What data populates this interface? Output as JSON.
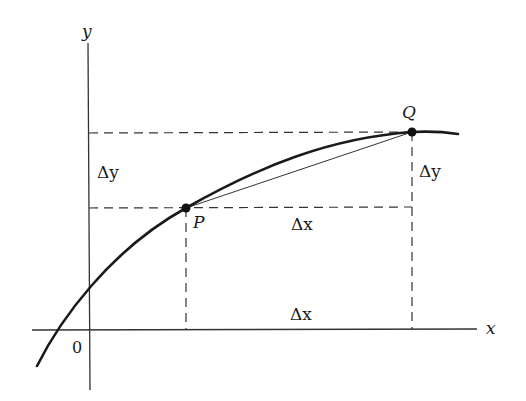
{
  "diagram": {
    "axes": {
      "x_label": "x",
      "y_label": "y",
      "origin_label": "0"
    },
    "points": {
      "P": {
        "label": "P"
      },
      "Q": {
        "label": "Q"
      }
    },
    "increments": {
      "dy_left": "Δy",
      "dy_right": "Δy",
      "dx_middle": "Δx",
      "dx_bottom": "Δx"
    },
    "colors": {
      "ink": "#1a1a1a",
      "background": "#ffffff"
    }
  }
}
